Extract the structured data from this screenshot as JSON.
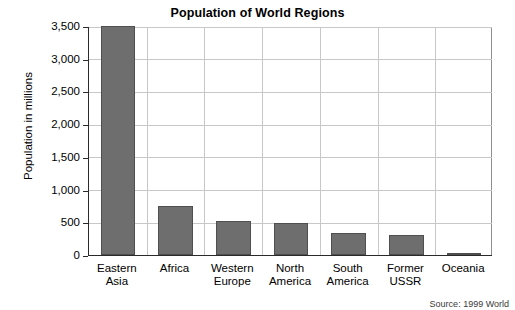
{
  "chart_data": {
    "type": "bar",
    "title": "Population of World Regions",
    "xlabel": "",
    "ylabel": "Population in millions",
    "categories": [
      "Eastern Asia",
      "Africa",
      "Western Europe",
      "North America",
      "South America",
      "Former USSR",
      "Oceania"
    ],
    "category_lines": [
      [
        "Eastern",
        "Asia"
      ],
      [
        "Africa",
        ""
      ],
      [
        "Western",
        "Europe"
      ],
      [
        "North",
        "America"
      ],
      [
        "South",
        "America"
      ],
      [
        "Former",
        "USSR"
      ],
      [
        "Oceania",
        ""
      ]
    ],
    "values": [
      3500,
      750,
      520,
      495,
      340,
      300,
      30
    ],
    "ylim": [
      0,
      3500
    ],
    "yticks": [
      0,
      500,
      1000,
      1500,
      2000,
      2500,
      3000,
      3500
    ],
    "ytick_labels": [
      "0",
      "500",
      "1,000",
      "1,500",
      "2,000",
      "2,500",
      "3,000",
      "3,500"
    ],
    "grid": true,
    "legend": false,
    "bar_color": "#6e6e6e",
    "bar_border_color": "#4f4f4f",
    "grid_color": "#c8c8c8",
    "axis_color": "#2a2a2a"
  },
  "footer": {
    "source": "Source: 1999 World"
  }
}
